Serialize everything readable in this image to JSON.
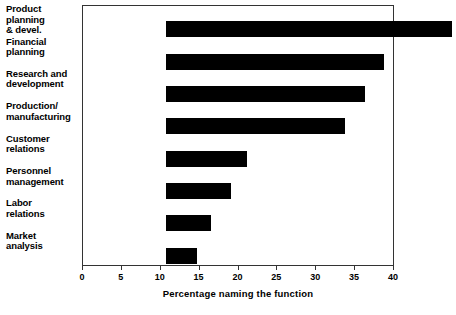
{
  "chart_data": {
    "type": "bar",
    "orientation": "horizontal",
    "title": "",
    "xlabel": "Percentage naming the function",
    "ylabel": "",
    "xlim": [
      0,
      40
    ],
    "xticks": [
      0,
      5,
      10,
      15,
      20,
      25,
      30,
      35,
      40
    ],
    "grid": false,
    "legend": null,
    "bar_color": "#000000",
    "categories": [
      "Product planning\n& devel.",
      "Financial\nplanning",
      "Research and\ndevelopment",
      "Production/\nmanufacturing",
      "Customer\nrelations",
      "Personnel\nmanagement",
      "Labor\nrelations",
      "Market\nanalysis"
    ],
    "values": [
      36.8,
      28,
      25.6,
      23,
      10.4,
      8.3,
      5.8,
      4
    ]
  }
}
